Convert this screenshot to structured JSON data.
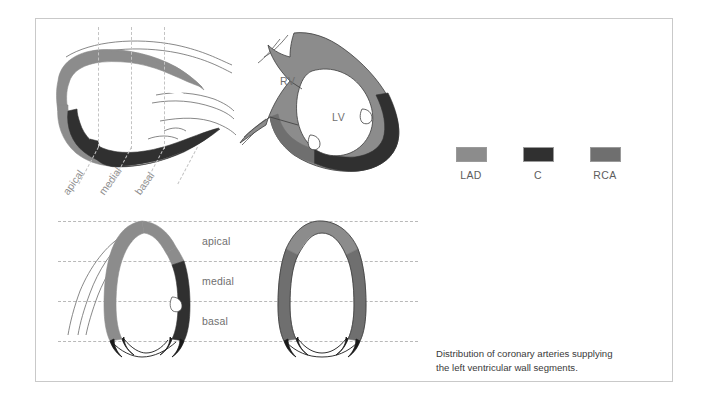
{
  "figure": {
    "caption_line1": "Distribution of coronary arteries supplying",
    "caption_line2": "the left ventricular wall segments."
  },
  "legend": {
    "items": [
      {
        "label": "LAD",
        "color": "#8c8c8c"
      },
      {
        "label": "C",
        "color": "#303030"
      },
      {
        "label": "RCA",
        "color": "#6f6f6f"
      }
    ]
  },
  "panels": {
    "horizontal_long_axis": {
      "name": "horizontal long axis view",
      "zone_labels": [
        "apical",
        "medial",
        "basal"
      ]
    },
    "short_axis": {
      "name": "short axis view",
      "chamber_labels": [
        "RV",
        "LV"
      ]
    },
    "vertical_long_axis": {
      "name": "vertical long axis views",
      "zone_labels": [
        "apical",
        "medial",
        "basal"
      ]
    }
  },
  "colors": {
    "lad": "#8c8c8c",
    "c": "#303030",
    "rca": "#6f6f6f",
    "outline": "#1a1a1a",
    "guide": "#b9b9b9",
    "frame": "#c9c9c9",
    "label": "#6f6f6f"
  }
}
